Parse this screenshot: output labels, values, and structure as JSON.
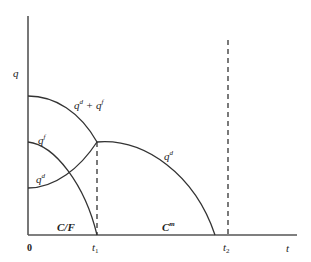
{
  "diagram": {
    "type": "economics-phase-diagram",
    "axes": {
      "y_label": "q",
      "x_label": "t",
      "origin_label": "0",
      "x_ticks": [
        {
          "label": "t",
          "sub": "1"
        },
        {
          "label": "t",
          "sub": "2"
        }
      ]
    },
    "curves": [
      {
        "id": "total",
        "label_base": "q",
        "label_sup": "d",
        "label_plus": " + ",
        "label_base2": "q",
        "label_sup2": "f"
      },
      {
        "id": "qf",
        "label_base": "q",
        "label_sup": "f"
      },
      {
        "id": "qd_rising",
        "label_base": "q",
        "label_sup": "d"
      },
      {
        "id": "qd_falling",
        "label_base": "q",
        "label_sup": "d"
      }
    ],
    "regions": [
      {
        "id": "cf",
        "label": "C/F"
      },
      {
        "id": "cm",
        "label_base": "C",
        "label_sup": "m"
      }
    ],
    "colors": {
      "axis": "#555555",
      "curve": "#333333",
      "dash": "#333333",
      "background": "#ffffff"
    }
  }
}
